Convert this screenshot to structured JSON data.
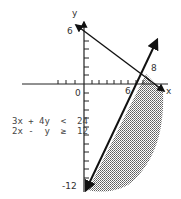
{
  "axes": {
    "x_label": "x",
    "y_label": "y",
    "origin_label": "0",
    "y_intercept_label": "6",
    "x_intercept_label": "6",
    "x_point_label": "8",
    "y_bottom_label": "-12"
  },
  "inequalities": {
    "line1": "3x + 4y  <  24",
    "line2": "2x -  y  ≥  12"
  },
  "colors": {
    "line": "#111111",
    "shade": "#9a9a9a",
    "text": "#333333"
  }
}
